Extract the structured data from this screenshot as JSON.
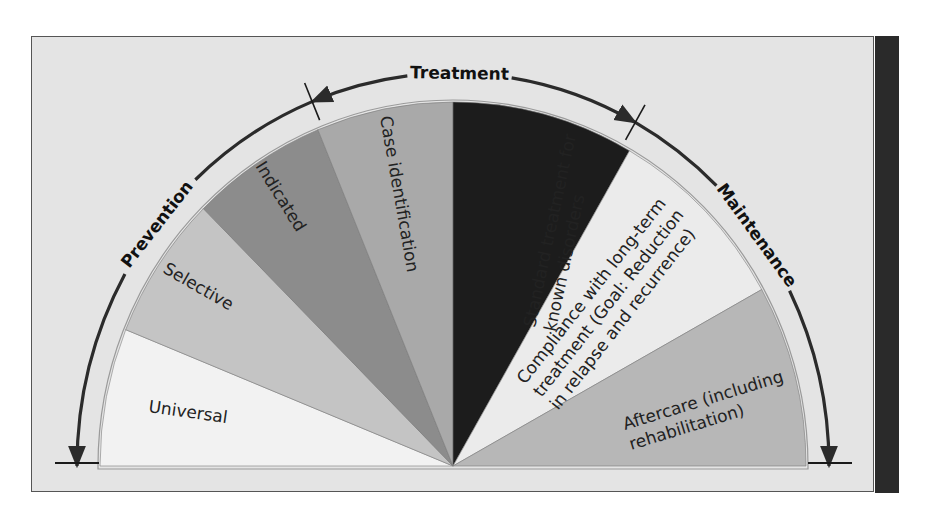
{
  "geometry": {
    "cx": 453,
    "cy": 466,
    "rx": 353,
    "ry": 364,
    "outer_rx": 376,
    "outer_ry": 393
  },
  "colors": {
    "frame_bg": "#e4e4e4",
    "side_bar": "#2a2a2a",
    "rim_band": "#eeeeee",
    "arc_stroke": "#2b2b2b"
  },
  "wedges": [
    {
      "id": "universal",
      "label": "Universal",
      "start_deg": 158,
      "end_deg": 180,
      "fill": "#f2f2f2",
      "text_color": "#222",
      "lines": [
        "Universal"
      ],
      "label_x": 148,
      "label_y": 412,
      "label_rotate": 8
    },
    {
      "id": "selective",
      "label": "Selective",
      "start_deg": 135,
      "end_deg": 158,
      "fill": "#c4c4c4",
      "text_color": "#222",
      "lines": [
        "Selective"
      ],
      "label_x": 162,
      "label_y": 272,
      "label_rotate": 30
    },
    {
      "id": "indicated",
      "label": "Indicated",
      "start_deg": 112.5,
      "end_deg": 135,
      "fill": "#8c8c8c",
      "text_color": "#222",
      "lines": [
        "Indicated"
      ],
      "label_x": 255,
      "label_y": 166,
      "label_rotate": 58
    },
    {
      "id": "case-identification",
      "label": "Case identification",
      "start_deg": 90,
      "end_deg": 112.5,
      "fill": "#a9a9a9",
      "text_color": "#222",
      "lines": [
        "Case identification"
      ],
      "label_x": 380,
      "label_y": 117,
      "label_rotate": 80
    },
    {
      "id": "standard-treatment",
      "label": "Standard treatment for known disorders",
      "start_deg": 60,
      "end_deg": 90,
      "fill": "#1c1c1c",
      "text_color": "#262626",
      "lines": [
        "Standard treatment for",
        "known disorders"
      ],
      "label_x": 535,
      "label_y": 328,
      "label_rotate": -78
    },
    {
      "id": "compliance",
      "label": "Compliance with long-term treatment (Goal: Reduction in relapse and recurrence)",
      "start_deg": 29,
      "end_deg": 60,
      "fill": "#ebebeb",
      "text_color": "#222",
      "lines": [
        "Compliance with long-term",
        "treatment (Goal: Reduction",
        "in relapse and recurrence)"
      ],
      "label_x": 525,
      "label_y": 385,
      "label_rotate": -52
    },
    {
      "id": "aftercare",
      "label": "Aftercare (including rehabilitation)",
      "start_deg": 0,
      "end_deg": 29,
      "fill": "#b7b7b7",
      "text_color": "#222",
      "lines": [
        "Aftercare (including",
        "rehabilitation)"
      ],
      "label_x": 625,
      "label_y": 430,
      "label_rotate": -17
    }
  ],
  "phases": [
    {
      "id": "prevention",
      "label": "Prevention",
      "from_deg": 180,
      "to_deg": 112,
      "label_deg": 142,
      "arrow_at": "start"
    },
    {
      "id": "treatment",
      "label": "Treatment",
      "from_deg": 112,
      "to_deg": 61,
      "label_deg": 89,
      "arrow_at": "both"
    },
    {
      "id": "maintenance",
      "label": "Maintenance",
      "from_deg": 61,
      "to_deg": 0,
      "label_deg": 36,
      "arrow_at": "end"
    }
  ],
  "ticks": [
    {
      "id": "prevention-treatment-divider",
      "deg": 112
    },
    {
      "id": "treatment-maintenance-divider",
      "deg": 61
    }
  ],
  "baselines": [
    {
      "id": "left-baseline",
      "x1": 55,
      "x2": 99,
      "y": 463
    },
    {
      "id": "right-baseline",
      "x1": 808,
      "x2": 852,
      "y": 463
    }
  ]
}
